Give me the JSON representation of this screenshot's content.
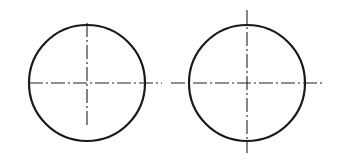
{
  "diagram": {
    "type": "technical-drawing-centerlines",
    "colors": {
      "background": "#ffffff",
      "outline": "#1a1a1a",
      "centerline": "#222222"
    },
    "figures": [
      {
        "id": "left-circle",
        "center": [
          87,
          83
        ],
        "radius": 58,
        "centerlines": {
          "horizontal": {
            "x1": 29,
            "x2": 162,
            "y": 83
          },
          "vertical": {
            "x": 87,
            "y1": 23,
            "y2": 128
          }
        },
        "note": "vertical centerline stops inside circle; horizontal extends beyond right edge only"
      },
      {
        "id": "right-circle",
        "center": [
          247,
          83
        ],
        "radius": 58,
        "centerlines": {
          "horizontal": {
            "x1": 171,
            "x2": 322,
            "y": 83
          },
          "vertical": {
            "x": 247,
            "y1": 10,
            "y2": 153
          }
        },
        "note": "both centerlines extend beyond circle on both sides"
      }
    ]
  }
}
